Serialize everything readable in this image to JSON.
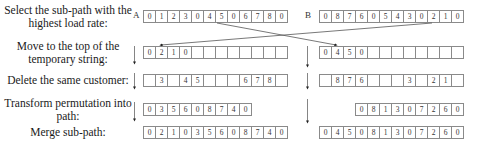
{
  "steps": [
    {
      "label": "Select the sub-path with the highest load rate:"
    },
    {
      "label": "Move to the top of the temporary string:"
    },
    {
      "label": "Delete the same customer:"
    },
    {
      "label": "Transform  permutation into path:"
    },
    {
      "label": "Merge sub-path:"
    }
  ],
  "parents": {
    "a_label": "A",
    "b_label": "B"
  },
  "rows": {
    "select": {
      "left": [
        "0",
        "1",
        "2",
        "3",
        "0",
        "4",
        "5",
        "0",
        "6",
        "7",
        "8",
        "0"
      ],
      "right": [
        "0",
        "8",
        "7",
        "6",
        "0",
        "5",
        "4",
        "3",
        "0",
        "2",
        "1",
        "0"
      ]
    },
    "move": {
      "left": [
        "0",
        "2",
        "1",
        "0",
        "",
        "",
        "",
        "",
        "",
        "",
        "",
        ""
      ],
      "right": [
        "0",
        "4",
        "5",
        "0",
        "",
        "",
        "",
        "",
        "",
        "",
        "",
        ""
      ]
    },
    "delete": {
      "left": [
        "",
        "3",
        "",
        "4",
        "5",
        "",
        "",
        "",
        "6",
        "7",
        "8",
        ""
      ],
      "right": [
        "",
        "8",
        "7",
        "6",
        "",
        "",
        "",
        "3",
        "",
        "2",
        "1",
        ""
      ]
    },
    "transform": {
      "left": [
        "0",
        "3",
        "5",
        "6",
        "0",
        "8",
        "7",
        "4",
        "0"
      ],
      "right": [
        "0",
        "8",
        "1",
        "3",
        "0",
        "7",
        "2",
        "6",
        "0"
      ]
    },
    "merge": {
      "left": [
        "0",
        "2",
        "1",
        "0",
        "3",
        "5",
        "6",
        "0",
        "8",
        "7",
        "4",
        "0"
      ],
      "right": [
        "0",
        "4",
        "5",
        "0",
        "8",
        "1",
        "3",
        "0",
        "7",
        "2",
        "6",
        "0"
      ]
    }
  }
}
